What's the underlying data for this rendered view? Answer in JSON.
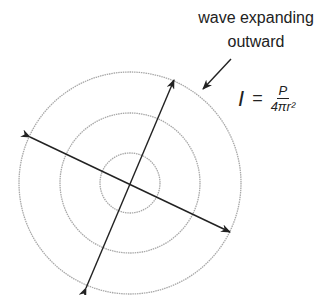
{
  "label": {
    "line1": "wave expanding",
    "line2": "outward"
  },
  "formula": {
    "lhs": "I",
    "equals": "=",
    "numerator": "P",
    "denominator": "4πr²"
  },
  "colors": {
    "circle": "#a8a8a8",
    "arrow": "#222222",
    "text": "#222222"
  }
}
